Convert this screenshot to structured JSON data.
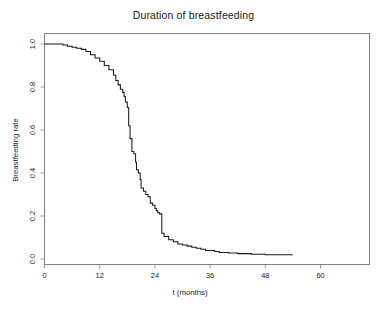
{
  "figure": {
    "title": "Duration of breastfeeding",
    "background_color": "#ffffff",
    "frame_color": "#808080",
    "curve_color": "#1a1a1a"
  },
  "axes": {
    "x_axis_title": "t (months)",
    "y_axis_title": "Breastfeeding rate",
    "x_tick_labels": [
      "0",
      "12",
      "24",
      "36",
      "48",
      "60"
    ],
    "y_tick_labels": [
      "0.0",
      "0.2",
      "0.4",
      "0.6",
      "0.8",
      "1.0"
    ]
  },
  "chart_data": {
    "type": "line",
    "title": "Duration of breastfeeding",
    "subtitle": "",
    "xlabel": "t (months)",
    "ylabel": "Breastfeeding rate",
    "xlim": [
      0,
      63
    ],
    "ylim": [
      0.0,
      1.0
    ],
    "xticks": [
      0,
      12,
      24,
      36,
      48,
      60
    ],
    "yticks": [
      0.0,
      0.2,
      0.4,
      0.6,
      0.8,
      1.0
    ],
    "grid": false,
    "legend": "none",
    "step_style": "post",
    "annotation": "Kaplan-Meier style step survival curve: breastfeeding rate declines from 1.00 to about 0.02 by 54 months, with the steepest drop between 17 and 25 months.",
    "series": [
      {
        "name": "Breastfeeding rate",
        "x": [
          0,
          1,
          2,
          3,
          4,
          5,
          6,
          7,
          8,
          9,
          10,
          11,
          12,
          13,
          14,
          15,
          15.5,
          16,
          16.5,
          17,
          17.3,
          17.6,
          18,
          18.3,
          18.6,
          19,
          19.4,
          19.8,
          20,
          20.4,
          20.8,
          21,
          21.5,
          22,
          22.5,
          23,
          23.5,
          24,
          24.3,
          24.6,
          25,
          25.5,
          26,
          27,
          28,
          29,
          30,
          31,
          32,
          33,
          34,
          35,
          36,
          37,
          38,
          40,
          42,
          45,
          48,
          51,
          54
        ],
        "y": [
          1.0,
          1.0,
          1.0,
          1.0,
          0.995,
          0.99,
          0.985,
          0.98,
          0.975,
          0.965,
          0.95,
          0.935,
          0.92,
          0.9,
          0.88,
          0.855,
          0.83,
          0.81,
          0.79,
          0.775,
          0.755,
          0.73,
          0.705,
          0.62,
          0.56,
          0.5,
          0.49,
          0.45,
          0.415,
          0.4,
          0.37,
          0.33,
          0.315,
          0.3,
          0.29,
          0.26,
          0.25,
          0.235,
          0.225,
          0.215,
          0.21,
          0.12,
          0.105,
          0.09,
          0.08,
          0.07,
          0.065,
          0.06,
          0.055,
          0.05,
          0.045,
          0.04,
          0.04,
          0.035,
          0.03,
          0.028,
          0.025,
          0.022,
          0.02,
          0.02,
          0.02
        ]
      }
    ]
  }
}
